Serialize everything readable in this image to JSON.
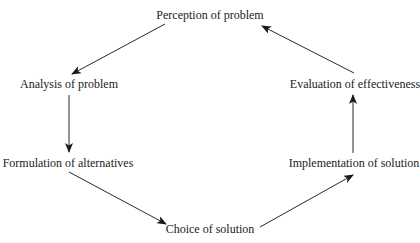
{
  "diagram": {
    "type": "cycle",
    "nodes": [
      {
        "id": "perception",
        "label": "Perception of problem",
        "x": 210,
        "y": 15
      },
      {
        "id": "analysis",
        "label": "Analysis of problem",
        "x": 69,
        "y": 84
      },
      {
        "id": "formulation",
        "label": "Formulation of alternatives",
        "x": 68,
        "y": 163
      },
      {
        "id": "choice",
        "label": "Choice of solution",
        "x": 210,
        "y": 229
      },
      {
        "id": "implementation",
        "label": "Implementation of solution",
        "x": 354,
        "y": 163
      },
      {
        "id": "evaluation",
        "label": "Evaluation of effectiveness",
        "x": 355,
        "y": 84
      }
    ],
    "edges": [
      {
        "from": "perception",
        "to": "analysis"
      },
      {
        "from": "analysis",
        "to": "formulation"
      },
      {
        "from": "formulation",
        "to": "choice"
      },
      {
        "from": "choice",
        "to": "implementation"
      },
      {
        "from": "implementation",
        "to": "evaluation"
      },
      {
        "from": "evaluation",
        "to": "perception"
      }
    ],
    "colors": {
      "line": "#2a2a2a",
      "text": "#1a1a1a",
      "background": "#ffffff"
    }
  }
}
